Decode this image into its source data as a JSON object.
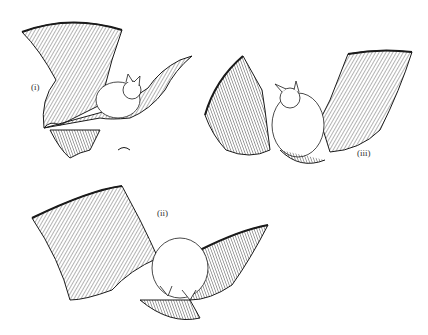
{
  "figure": {
    "labels": {
      "i": "(i)",
      "ii": "(ii)",
      "iii": "(iii)"
    },
    "colors": {
      "ink": "#1a1a1a",
      "paper": "#ffffff",
      "hatch": "#555555"
    }
  }
}
